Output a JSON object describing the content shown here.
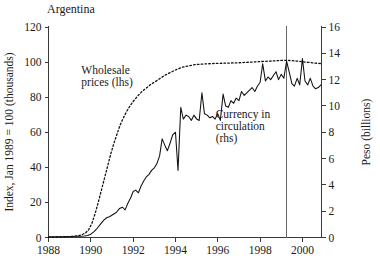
{
  "chart_data": {
    "type": "line",
    "title": "Argentina",
    "xlabel": "",
    "ylabel": "Index, Jan 1989 = 100 (thousands)",
    "y2label": "Peso (billions)",
    "xlim": [
      1988.0,
      2000.9
    ],
    "ylim": [
      0,
      120
    ],
    "y2lim": [
      0,
      16
    ],
    "xticks": [
      1988,
      1990,
      1992,
      1994,
      1996,
      1998,
      2000
    ],
    "xtick_labels": [
      "1988",
      "1990",
      "1992",
      "1994",
      "1996",
      "1998",
      "2000"
    ],
    "yticks": [
      0,
      20,
      40,
      60,
      80,
      100,
      120
    ],
    "ytick_labels": [
      "0",
      "20",
      "40",
      "60",
      "80",
      "100",
      "120"
    ],
    "y2ticks": [
      0,
      2,
      4,
      6,
      8,
      10,
      12,
      14,
      16
    ],
    "y2tick_labels": [
      "0",
      "2",
      "4",
      "6",
      "8",
      "10",
      "12",
      "14",
      "16"
    ],
    "grid": false,
    "legend_position": "inline-annotation",
    "annotations": [
      {
        "name": "wholesale-prices-label",
        "lines": [
          "Wholesale",
          "prices (lhs)"
        ],
        "x": 1989.55,
        "y": 93
      },
      {
        "name": "currency-in-circulation-label",
        "lines": [
          "Currency in",
          "circulation",
          "(rhs)"
        ],
        "x": 1995.9,
        "y": 68
      }
    ],
    "event_line": {
      "name": "vertical-marker",
      "x": 1999.25,
      "label": ""
    },
    "series": [
      {
        "name": "Wholesale prices (lhs)",
        "axis": "left",
        "style": "dotted",
        "x": [
          1988.0,
          1988.5,
          1989.0,
          1989.3,
          1989.55,
          1989.75,
          1989.9,
          1990.05,
          1990.2,
          1990.35,
          1990.5,
          1990.65,
          1990.8,
          1990.95,
          1991.1,
          1991.25,
          1991.4,
          1991.55,
          1991.7,
          1991.85,
          1992.0,
          1992.2,
          1992.4,
          1992.6,
          1992.8,
          1993.0,
          1993.25,
          1993.5,
          1993.75,
          1994.0,
          1994.3,
          1994.6,
          1994.9,
          1995.2,
          1995.5,
          1995.8,
          1996.1,
          1996.4,
          1996.7,
          1997.0,
          1997.3,
          1997.6,
          1997.9,
          1998.2,
          1998.5,
          1998.8,
          1999.1,
          1999.4,
          1999.7,
          2000.0,
          2000.3,
          2000.6,
          2000.85
        ],
        "y": [
          0.2,
          0.3,
          0.5,
          0.8,
          1.4,
          2.6,
          4.5,
          8.0,
          13.5,
          20.0,
          27.0,
          34.0,
          41.0,
          48.0,
          54.0,
          59.5,
          64.5,
          68.5,
          72.0,
          75.0,
          77.5,
          80.5,
          83.0,
          85.0,
          87.0,
          88.5,
          90.5,
          92.5,
          94.0,
          95.5,
          97.0,
          97.8,
          98.5,
          98.8,
          99.0,
          99.2,
          99.3,
          99.4,
          99.5,
          99.6,
          99.8,
          100.0,
          100.2,
          100.4,
          100.6,
          100.8,
          101.0,
          100.9,
          100.6,
          100.2,
          99.8,
          99.4,
          99.2
        ]
      },
      {
        "name": "Currency in circulation (rhs)",
        "axis": "right",
        "style": "solid",
        "units": "Peso (billions)",
        "x": [
          1988.0,
          1988.3,
          1988.6,
          1988.9,
          1989.1,
          1989.3,
          1989.5,
          1989.7,
          1989.85,
          1990.0,
          1990.15,
          1990.3,
          1990.45,
          1990.6,
          1990.75,
          1990.9,
          1991.05,
          1991.2,
          1991.35,
          1991.5,
          1991.62,
          1991.75,
          1991.88,
          1992.0,
          1992.12,
          1992.25,
          1992.37,
          1992.5,
          1992.62,
          1992.75,
          1992.87,
          1993.0,
          1993.12,
          1993.25,
          1993.37,
          1993.5,
          1993.62,
          1993.75,
          1993.87,
          1994.0,
          1994.12,
          1994.25,
          1994.37,
          1994.5,
          1994.62,
          1994.75,
          1994.87,
          1995.0,
          1995.12,
          1995.25,
          1995.37,
          1995.5,
          1995.62,
          1995.75,
          1995.87,
          1996.0,
          1996.12,
          1996.25,
          1996.37,
          1996.5,
          1996.62,
          1996.75,
          1996.87,
          1997.0,
          1997.12,
          1997.25,
          1997.37,
          1997.5,
          1997.62,
          1997.75,
          1997.87,
          1998.0,
          1998.12,
          1998.25,
          1998.37,
          1998.5,
          1998.62,
          1998.75,
          1998.87,
          1999.0,
          1999.12,
          1999.25,
          1999.37,
          1999.5,
          1999.62,
          1999.75,
          1999.87,
          2000.0,
          2000.12,
          2000.25,
          2000.37,
          2000.5,
          2000.62,
          2000.75,
          2000.87
        ],
        "y": [
          0.05,
          0.05,
          0.06,
          0.07,
          0.08,
          0.09,
          0.1,
          0.12,
          0.15,
          0.25,
          0.45,
          0.7,
          1.0,
          1.3,
          1.5,
          1.6,
          1.75,
          1.9,
          2.2,
          2.3,
          2.1,
          2.6,
          3.0,
          3.5,
          3.6,
          3.4,
          3.9,
          4.3,
          4.6,
          4.8,
          5.1,
          5.3,
          5.6,
          6.2,
          7.5,
          7.0,
          6.6,
          7.2,
          7.8,
          8.0,
          5.1,
          9.9,
          9.0,
          9.3,
          9.2,
          8.9,
          9.3,
          9.0,
          8.9,
          11.0,
          9.4,
          9.3,
          9.1,
          9.2,
          9.0,
          9.4,
          8.9,
          10.9,
          10.0,
          9.9,
          10.4,
          10.2,
          10.6,
          10.4,
          11.1,
          10.8,
          11.0,
          11.2,
          11.4,
          11.1,
          11.5,
          11.8,
          13.2,
          11.9,
          12.2,
          12.0,
          12.3,
          12.6,
          12.0,
          12.4,
          12.1,
          13.4,
          12.6,
          11.7,
          11.5,
          12.1,
          11.6,
          13.6,
          11.9,
          11.6,
          12.1,
          11.5,
          11.3,
          11.4,
          11.6
        ]
      }
    ]
  }
}
